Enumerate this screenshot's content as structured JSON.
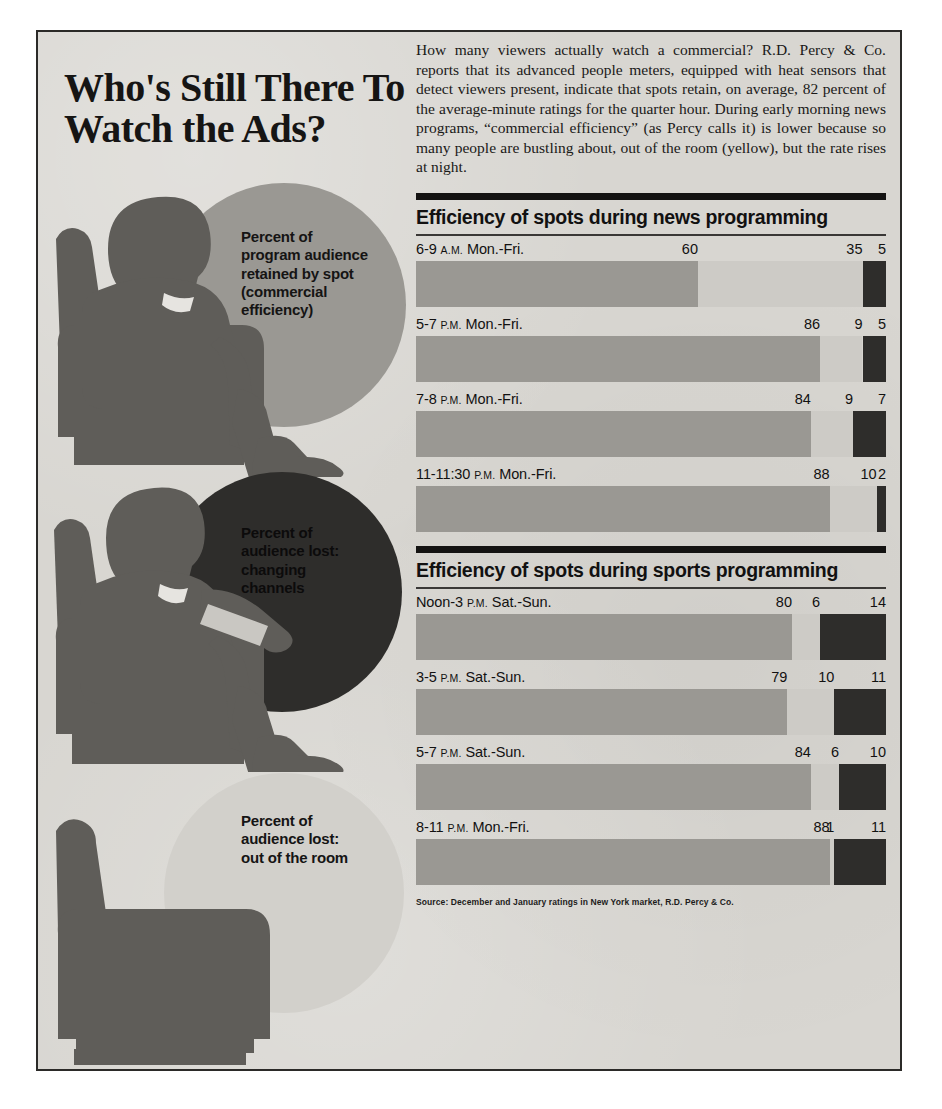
{
  "headline": "Who's Still There\nTo Watch the Ads?",
  "lede": "How many viewers actually watch a commercial? R.D. Percy & Co. reports that its advanced people meters, equipped with heat sensors that detect viewers present, indicate that spots retain, on average, 82 percent of the average-minute ratings for the quarter hour. During early morning news programs, “commercial efficiency” (as Percy calls it) is lower because so many people are bustling about, out of the room (yellow), but the rate rises at night.",
  "legends": [
    "Percent of\nprogram audience\nretained by spot\n(commercial\nefficiency)",
    "Percent of\naudience lost:\nchanging\nchannels",
    "Percent of\naudience lost:\nout of the room"
  ],
  "illustrations": [
    {
      "name": "seated-man-watching",
      "circle": "medium-gray"
    },
    {
      "name": "seated-man-with-remote",
      "circle": "dark"
    },
    {
      "name": "empty-armchair",
      "circle": "pale"
    }
  ],
  "sections": [
    {
      "title": "Efficiency of spots during news programming",
      "rows": [
        {
          "label": "6-9 ",
          "sc": "A.M.",
          "label2": " Mon.-Fri.",
          "retained": 60,
          "room": 35,
          "channel": 5
        },
        {
          "label": "5-7 ",
          "sc": "P.M.",
          "label2": " Mon.-Fri.",
          "retained": 86,
          "room": 9,
          "channel": 5
        },
        {
          "label": "7-8 ",
          "sc": "P.M.",
          "label2": " Mon.-Fri.",
          "retained": 84,
          "room": 9,
          "channel": 7
        },
        {
          "label": "11-11:30 ",
          "sc": "P.M.",
          "label2": " Mon.-Fri.",
          "retained": 88,
          "room": 10,
          "channel": 2
        }
      ]
    },
    {
      "title": "Efficiency of spots during sports programming",
      "rows": [
        {
          "label": "Noon-3 ",
          "sc": "P.M.",
          "label2": " Sat.-Sun.",
          "retained": 80,
          "room": 6,
          "channel": 14
        },
        {
          "label": "3-5 ",
          "sc": "P.M.",
          "label2": " Sat.-Sun.",
          "retained": 79,
          "room": 10,
          "channel": 11
        },
        {
          "label": "5-7 ",
          "sc": "P.M.",
          "label2": " Sat.-Sun.",
          "retained": 84,
          "room": 6,
          "channel": 10
        },
        {
          "label": "8-11 ",
          "sc": "P.M.",
          "label2": " Mon.-Fri.",
          "retained": 88,
          "room": 1,
          "channel": 11
        }
      ]
    }
  ],
  "source": "Source: December and January ratings in New York market, R.D. Percy & Co.",
  "colors": {
    "retained": "#9a9893",
    "out_of_room": "#cdcbc6",
    "changing_channels": "#2e2d2b",
    "background": "#d8d6d1",
    "ink": "#141312"
  },
  "chart_data": {
    "type": "bar",
    "title": "Who's Still There To Watch the Ads?",
    "subtype": "stacked-horizontal-100pct",
    "xlabel": "Percent",
    "ylabel": "",
    "xlim": [
      0,
      100
    ],
    "grid": false,
    "legend_position": "left-illustrations",
    "series": [
      {
        "name": "Percent of program audience retained by spot (commercial efficiency)",
        "color": "#9a9893",
        "values": [
          60,
          86,
          84,
          88,
          80,
          79,
          84,
          88
        ]
      },
      {
        "name": "Percent of audience lost: out of the room",
        "color": "#cdcbc6",
        "values": [
          35,
          9,
          9,
          10,
          6,
          10,
          6,
          1
        ]
      },
      {
        "name": "Percent of audience lost: changing channels",
        "color": "#2e2d2b",
        "values": [
          5,
          5,
          7,
          2,
          14,
          11,
          10,
          11
        ]
      }
    ],
    "categories": [
      "6-9 A.M. Mon.-Fri.",
      "5-7 P.M. Mon.-Fri.",
      "7-8 P.M. Mon.-Fri.",
      "11-11:30 P.M. Mon.-Fri.",
      "Noon-3 P.M. Sat.-Sun.",
      "3-5 P.M. Sat.-Sun.",
      "5-7 P.M. Sat.-Sun.",
      "8-11 P.M. Mon.-Fri."
    ],
    "groups": [
      {
        "name": "Efficiency of spots during news programming",
        "categories": [
          0,
          1,
          2,
          3
        ]
      },
      {
        "name": "Efficiency of spots during sports programming",
        "categories": [
          4,
          5,
          6,
          7
        ]
      }
    ],
    "annotations": [
      "Source: December and January ratings in New York market, R.D. Percy & Co."
    ]
  }
}
